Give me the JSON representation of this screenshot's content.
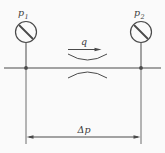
{
  "labels": {
    "gauge_left": {
      "base": "p",
      "sub": "1"
    },
    "gauge_right": {
      "base": "p",
      "sub": "2"
    },
    "flow": "q",
    "differential_pressure": "Δp"
  },
  "colors": {
    "line": "#4a4a4a",
    "background": "#fafafa",
    "text": "#3b3b3b"
  }
}
